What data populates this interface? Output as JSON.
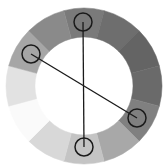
{
  "diagram": {
    "type": "color-wheel",
    "center": [
      84,
      86
    ],
    "outer_radius": 78,
    "inner_radius": 49,
    "segments": [
      {
        "start_deg": -15,
        "end_deg": 15,
        "color": "#7a7a7a"
      },
      {
        "start_deg": 15,
        "end_deg": 45,
        "color": "#6e6e6e"
      },
      {
        "start_deg": 45,
        "end_deg": 75,
        "color": "#646464"
      },
      {
        "start_deg": 75,
        "end_deg": 105,
        "color": "#6a6a6a"
      },
      {
        "start_deg": 105,
        "end_deg": 135,
        "color": "#808080"
      },
      {
        "start_deg": 135,
        "end_deg": 165,
        "color": "#a8a8a8"
      },
      {
        "start_deg": 165,
        "end_deg": 195,
        "color": "#c4c4c4"
      },
      {
        "start_deg": 195,
        "end_deg": 225,
        "color": "#d8d8d8"
      },
      {
        "start_deg": 225,
        "end_deg": 255,
        "color": "#fafafa"
      },
      {
        "start_deg": 255,
        "end_deg": 285,
        "color": "#e2e2e2"
      },
      {
        "start_deg": 285,
        "end_deg": 315,
        "color": "#a6a6a6"
      },
      {
        "start_deg": 315,
        "end_deg": 345,
        "color": "#8a8a8a"
      }
    ],
    "markers": [
      {
        "x": 83,
        "y": 22,
        "r": 9
      },
      {
        "x": 31,
        "y": 54,
        "r": 9
      },
      {
        "x": 137,
        "y": 118,
        "r": 9
      },
      {
        "x": 84,
        "y": 147,
        "r": 9
      }
    ],
    "connectors": [
      {
        "from": 0,
        "to": 3
      },
      {
        "from": 1,
        "to": 2
      }
    ],
    "stroke_color": "#1a1a1a"
  }
}
